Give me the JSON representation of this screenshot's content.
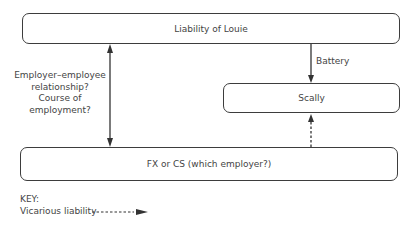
{
  "nodes": {
    "top": {
      "label": "Liability of Louie"
    },
    "scally": {
      "label": "Scally"
    },
    "bottom": {
      "label": "FX or CS (which employer?)"
    }
  },
  "edges": {
    "left_label_lines": [
      "Employer–employee",
      "relationship?",
      "Course of",
      "employment?"
    ],
    "battery_label": "Battery"
  },
  "key": {
    "title": "KEY:",
    "vicarious_label": "Vicarious liability"
  }
}
